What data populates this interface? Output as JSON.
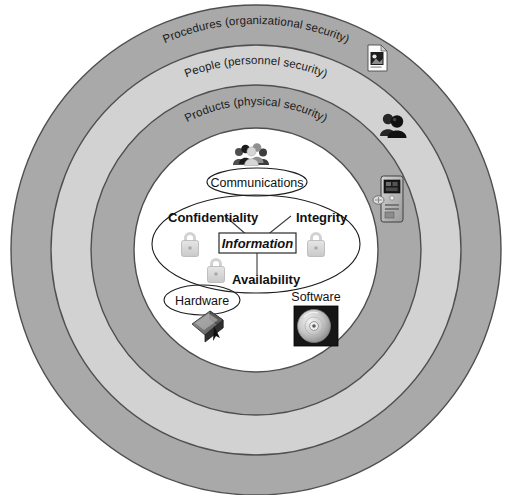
{
  "diagram": {
    "type": "concentric-rings",
    "background_color": "#ffffff",
    "center": {
      "x": 256,
      "y": 250
    },
    "outer_radius": 245
  },
  "rings": [
    {
      "id": "procedures",
      "label": "Procedures (organizational security)",
      "fill": "#a9a9a9",
      "stroke": "#555555",
      "outer_radius": 245,
      "inner_radius": 205,
      "icon": "document-icon",
      "icon_position": {
        "x": 377,
        "y": 57
      }
    },
    {
      "id": "people",
      "label": "People (personnel security)",
      "fill": "#d2d2d2",
      "stroke": "#555555",
      "outer_radius": 205,
      "inner_radius": 165,
      "icon": "people-pair-icon",
      "icon_position": {
        "x": 392,
        "y": 124
      }
    },
    {
      "id": "products",
      "label": "Products (physical security)",
      "fill": "#a9a9a9",
      "stroke": "#555555",
      "outer_radius": 165,
      "inner_radius": 122,
      "icon": "network-device-icon",
      "icon_position": {
        "x": 390,
        "y": 200
      }
    },
    {
      "id": "core",
      "label": "",
      "fill": "#ffffff",
      "stroke": "#555555",
      "outer_radius": 122,
      "inner_radius": 0,
      "icon": "",
      "icon_position": {
        "x": 0,
        "y": 0
      }
    }
  ],
  "core": {
    "people_group_icon": "people-group-icon",
    "communications": {
      "label": "Communications",
      "shape": "ellipse"
    },
    "triad": {
      "confidentiality": "Confidentiality",
      "integrity": "Integrity",
      "availability": "Availability",
      "center_label": "Information",
      "center_shape": "rectangle",
      "lock_icon": "padlock-icon",
      "lock_count": 3,
      "lock_color": "#d8d8d8"
    },
    "hardware": {
      "label": "Hardware",
      "shape": "ellipse",
      "icon": "hardware-device-icon"
    },
    "software": {
      "label": "Software",
      "shape": "plain",
      "icon": "compact-disc-icon"
    }
  }
}
